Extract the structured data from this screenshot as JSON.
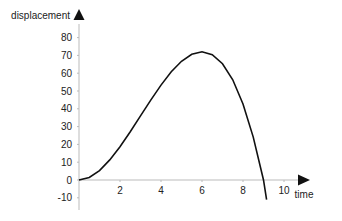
{
  "chart_data": {
    "type": "line",
    "title": "",
    "xlabel": "time",
    "ylabel": "displacement",
    "xlim": [
      0,
      11
    ],
    "ylim": [
      -10,
      85
    ],
    "x_ticks": [
      2,
      4,
      6,
      8,
      10
    ],
    "y_ticks": [
      -10,
      0,
      10,
      20,
      30,
      40,
      50,
      60,
      70,
      80
    ],
    "grid": false,
    "legend": null,
    "series": [
      {
        "name": "displacement",
        "x": [
          0,
          0.5,
          1,
          1.5,
          2,
          2.5,
          3,
          3.5,
          4,
          4.5,
          5,
          5.5,
          6,
          6.5,
          7,
          7.5,
          8,
          8.5,
          9,
          9.15
        ],
        "values": [
          0,
          1.4,
          5.3,
          11.3,
          18.7,
          27.1,
          36.0,
          44.9,
          53.3,
          60.8,
          66.7,
          70.6,
          72.0,
          70.4,
          65.3,
          56.3,
          42.7,
          24.1,
          0,
          -11
        ]
      }
    ]
  },
  "axes": {
    "x_label": "time",
    "y_label": "displacement",
    "x_tick_labels": [
      "2",
      "4",
      "6",
      "8",
      "10"
    ],
    "y_tick_labels": [
      "80",
      "70",
      "60",
      "50",
      "40",
      "30",
      "20",
      "10",
      "0",
      "-10"
    ]
  },
  "colors": {
    "curve": "#111111",
    "axis": "#bbbbbb",
    "arrow": "#111111",
    "text": "#222222"
  }
}
